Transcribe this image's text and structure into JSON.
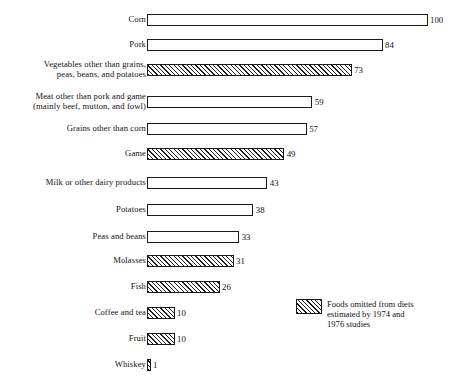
{
  "chart_data": {
    "type": "bar",
    "orientation": "horizontal",
    "title": "",
    "subtitle": "",
    "xlabel": "",
    "ylabel": "",
    "xlim": [
      0,
      100
    ],
    "grid": false,
    "legend_position": "inside-right-lower",
    "categories": [
      "Corn",
      "Pork",
      "Vegetables other than grains,\npeas, beans, and potatoes",
      "Meat other than pork and game\n(mainly beef, mutton, and fowl)",
      "Grains other than corn",
      "Game",
      "Milk or other dairy products",
      "Potatoes",
      "Peas and beans",
      "Molasses",
      "Fish",
      "Coffee and tea",
      "Fruit",
      "Whiskey"
    ],
    "values": [
      100,
      84,
      73,
      59,
      57,
      49,
      43,
      38,
      33,
      31,
      26,
      10,
      10,
      1
    ],
    "value_labels": [
      "100",
      "84",
      "73",
      "59",
      "57",
      "49",
      "43",
      "38",
      "33",
      "31",
      "26",
      "10",
      "10",
      "1"
    ],
    "hatched": [
      false,
      false,
      true,
      false,
      false,
      true,
      false,
      false,
      false,
      true,
      true,
      true,
      true,
      true
    ],
    "bars": [
      {
        "label": "Corn",
        "value": 100,
        "value_label": "100",
        "hatched": false,
        "top": 14
      },
      {
        "label": "Pork",
        "value": 84,
        "value_label": "84",
        "hatched": false,
        "top": 39
      },
      {
        "label": "Vegetables other than grains,\npeas, beans, and potatoes",
        "value": 73,
        "value_label": "73",
        "hatched": true,
        "top": 64
      },
      {
        "label": "Meat other than pork and game\n(mainly beef, mutton, and fowl)",
        "value": 59,
        "value_label": "59",
        "hatched": false,
        "top": 96
      },
      {
        "label": "Grains other than corn",
        "value": 57,
        "value_label": "57",
        "hatched": false,
        "top": 123
      },
      {
        "label": "Game",
        "value": 49,
        "value_label": "49",
        "hatched": true,
        "top": 148
      },
      {
        "label": "Milk or other dairy products",
        "value": 43,
        "value_label": "43",
        "hatched": false,
        "top": 177
      },
      {
        "label": "Potatoes",
        "value": 38,
        "value_label": "38",
        "hatched": false,
        "top": 204
      },
      {
        "label": "Peas and beans",
        "value": 33,
        "value_label": "33",
        "hatched": false,
        "top": 231
      },
      {
        "label": "Molasses",
        "value": 31,
        "value_label": "31",
        "hatched": true,
        "top": 255
      },
      {
        "label": "Fish",
        "value": 26,
        "value_label": "26",
        "hatched": true,
        "top": 281
      },
      {
        "label": "Coffee and tea",
        "value": 10,
        "value_label": "10",
        "hatched": true,
        "top": 307
      },
      {
        "label": "Fruit",
        "value": 10,
        "value_label": "10",
        "hatched": true,
        "top": 333
      },
      {
        "label": "Whiskey",
        "value": 1,
        "value_label": "1",
        "hatched": true,
        "top": 359
      }
    ],
    "legend": [
      {
        "swatch": "hatched",
        "text": "Foods omitted from diets\nestimated by 1974 and\n1976 studies"
      }
    ],
    "scale": {
      "px_per_unit": 2.81,
      "bar_origin_x": 146.5,
      "bar_height": 12
    },
    "colors": {
      "background": "#ffffff",
      "bar_fill": "#ffffff",
      "bar_stroke": "#1a1a1a",
      "hatch": "#1d1d1d",
      "text": "#111111"
    }
  }
}
